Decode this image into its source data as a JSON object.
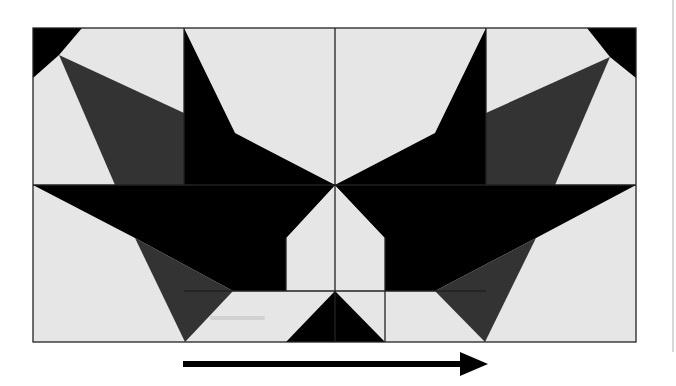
{
  "figure": {
    "colors": {
      "light": "#e6e6e6",
      "dark": "#333333",
      "black": "#000000",
      "outline": "#222222",
      "page_edge": "#d8d8d8"
    },
    "frame": {
      "x": 33,
      "y": 28,
      "width": 603,
      "height": 314
    },
    "grid": {
      "vertical_lines_x": [
        184,
        335,
        385,
        486
      ],
      "horizontal_line_y": 185
    },
    "arrow": {
      "direction": "right",
      "x1": 183,
      "x2": 488,
      "y": 364
    }
  }
}
